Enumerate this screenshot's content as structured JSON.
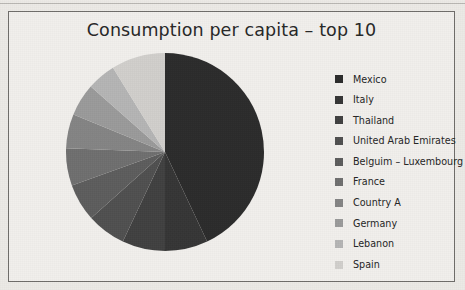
{
  "chart": {
    "title": "Consumption per capita – top 10",
    "frame_border_color": "#6f6d6a",
    "background_color": "#f1efec",
    "title_color": "#262626"
  },
  "legend": {
    "position": "right",
    "items": [
      {
        "label": "Mexico",
        "color": "#2b2b2b"
      },
      {
        "label": "Italy",
        "color": "#353535"
      },
      {
        "label": "Thailand",
        "color": "#404040"
      },
      {
        "label": "United Arab Emirates",
        "color": "#4f4f4f"
      },
      {
        "label": "Belguim – Luxembourg",
        "color": "#5c5c5c"
      },
      {
        "label": "France",
        "color": "#6e6e6e"
      },
      {
        "label": "Country A",
        "color": "#848484"
      },
      {
        "label": "Germany",
        "color": "#9a9a9a"
      },
      {
        "label": "Lebanon",
        "color": "#b4b4b4"
      },
      {
        "label": "Spain",
        "color": "#d0cecb"
      }
    ]
  },
  "chart_data": {
    "type": "pie",
    "title": "Consumption per capita – top 10",
    "xlabel": "",
    "ylabel": "",
    "legend_position": "right",
    "grid": false,
    "start_angle_deg": 0,
    "direction": "clockwise",
    "categories": [
      "Mexico",
      "Italy",
      "Thailand",
      "United Arab Emirates",
      "Belguim – Luxembourg",
      "France",
      "Country A",
      "Germany",
      "Lebanon",
      "Spain"
    ],
    "values": [
      43.0,
      7.0,
      7.0,
      6.4,
      6.1,
      6.1,
      5.6,
      5.3,
      4.7,
      8.8
    ],
    "value_unit": "percent",
    "slices": [
      {
        "label": "Mexico",
        "percent": 43.0,
        "start_deg": 0.0,
        "end_deg": 154.8,
        "color": "#2b2b2b"
      },
      {
        "label": "Italy",
        "percent": 7.0,
        "start_deg": 154.8,
        "end_deg": 180.0,
        "color": "#353535"
      },
      {
        "label": "Thailand",
        "percent": 7.0,
        "start_deg": 180.0,
        "end_deg": 205.2,
        "color": "#404040"
      },
      {
        "label": "United Arab Emirates",
        "percent": 6.4,
        "start_deg": 205.2,
        "end_deg": 228.2,
        "color": "#4f4f4f"
      },
      {
        "label": "Belguim – Luxembourg",
        "percent": 6.1,
        "start_deg": 228.2,
        "end_deg": 250.2,
        "color": "#5c5c5c"
      },
      {
        "label": "France",
        "percent": 6.1,
        "start_deg": 250.2,
        "end_deg": 272.1,
        "color": "#6e6e6e"
      },
      {
        "label": "Country A",
        "percent": 5.6,
        "start_deg": 272.1,
        "end_deg": 292.3,
        "color": "#848484"
      },
      {
        "label": "Germany",
        "percent": 5.3,
        "start_deg": 292.3,
        "end_deg": 311.4,
        "color": "#9a9a9a"
      },
      {
        "label": "Lebanon",
        "percent": 4.7,
        "start_deg": 311.4,
        "end_deg": 328.3,
        "color": "#b4b4b4"
      },
      {
        "label": "Spain",
        "percent": 8.8,
        "start_deg": 328.3,
        "end_deg": 360.0,
        "color": "#d0cecb"
      }
    ]
  }
}
